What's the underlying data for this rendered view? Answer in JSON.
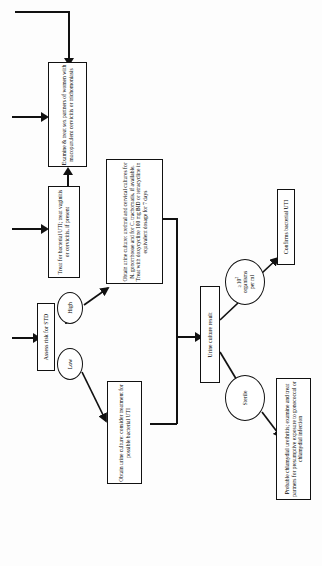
{
  "diagram": {
    "orientation": "rotated-90",
    "colors": {
      "stroke": "#111111",
      "fill": "#ffffff",
      "background": "#fdfdfd"
    }
  },
  "nodes": {
    "examine_treat_partners": {
      "id": "examine-treat-partners",
      "shape": "box",
      "text": "Examine & treat sex partners of women with mucopurulent cervicitis or trichomoniasis"
    },
    "treat_bacterial_uti": {
      "id": "treat-bacterial-uti",
      "shape": "box",
      "text": "Treat for bacterial UTI; treat vaginitis or cervicitis, if present"
    },
    "obtain_culture_high": {
      "id": "obtain-culture-high-risk",
      "shape": "box",
      "text": "Obtain urine culture: urethral and cervical cultures for N. gonorrhoeae and for C. trachomatis, if available. Treat with doxycycline 100 mg BID or tetracycline in equivalent dosage for 7 days",
      "lines": [
        "Obtain urine culture: urethral and",
        "cervical cultures for N. gonorrhoeae",
        "and for C. trachomatis, if available.",
        "Treat with doxycycline 100 mg",
        "BID or tetracycline in equivalent",
        "dosage for 7 days"
      ]
    },
    "assess_risk": {
      "id": "assess-risk-for-std",
      "shape": "box",
      "text": "Assess risk for STD"
    },
    "high": {
      "id": "branch-high",
      "shape": "ellipse",
      "text": "High"
    },
    "low": {
      "id": "branch-low",
      "shape": "ellipse",
      "text": "Low"
    },
    "obtain_culture_low": {
      "id": "obtain-culture-low-risk",
      "shape": "box",
      "text": "Obtain urine culture: consider treatment for possible bacterial UTI",
      "lines": [
        "Obtain urine culture: consider",
        "treatment for possible",
        "bacterial UTI"
      ]
    },
    "urine_culture_result": {
      "id": "urine-culture-result",
      "shape": "box",
      "text": "Urine culture result"
    },
    "organisms": {
      "id": "result-positive",
      "shape": "ellipse",
      "line1": "≥10",
      "exponent": "2",
      "line2": "organisms",
      "line3": "per ml",
      "text": "≥10² organisms per ml"
    },
    "sterile": {
      "id": "result-sterile",
      "shape": "ellipse",
      "text": "Sterile"
    },
    "confirms_uti": {
      "id": "confirms-bacterial-uti",
      "shape": "box",
      "text": "Confirms bacterial UTI"
    },
    "probable_chlamydial": {
      "id": "probable-chlamydial-urethritis",
      "shape": "box",
      "text": "Probable chlamydial urethritis; examine and treat partners for presumptive exposure to gonococcal or chlamydial infection",
      "lines": [
        "Probable chlamydial urethritis; examine and",
        "treat partners for presumptive exposure",
        "to gonococcal or chlamydial infection"
      ]
    }
  },
  "edges": [
    {
      "id": "edge-feedback-to-examine",
      "from": "feedback-loop",
      "to": "examine-treat-partners",
      "label": ""
    },
    {
      "id": "edge-entry-to-examine",
      "from": "entry-left",
      "to": "examine-treat-partners",
      "label": ""
    },
    {
      "id": "edge-entry-to-treat",
      "from": "entry-left",
      "to": "treat-bacterial-uti",
      "label": ""
    },
    {
      "id": "edge-treat-to-examine",
      "from": "treat-bacterial-uti",
      "to": "examine-treat-partners",
      "label": ""
    },
    {
      "id": "edge-entry-to-assess",
      "from": "entry-left",
      "to": "assess-risk-for-std",
      "label": ""
    },
    {
      "id": "edge-assess-to-high",
      "from": "assess-risk-for-std",
      "to": "branch-high",
      "label": "High"
    },
    {
      "id": "edge-assess-to-low",
      "from": "assess-risk-for-std",
      "to": "branch-low",
      "label": "Low"
    },
    {
      "id": "edge-high-to-culture",
      "from": "branch-high",
      "to": "obtain-culture-high-risk",
      "label": ""
    },
    {
      "id": "edge-low-to-culture",
      "from": "branch-low",
      "to": "obtain-culture-low-risk",
      "label": ""
    },
    {
      "id": "edge-cultures-to-result",
      "from": "obtain-culture-merge",
      "to": "urine-culture-result",
      "label": ""
    },
    {
      "id": "edge-result-to-organisms",
      "from": "urine-culture-result",
      "to": "result-positive",
      "label": ""
    },
    {
      "id": "edge-result-to-sterile",
      "from": "urine-culture-result",
      "to": "result-sterile",
      "label": ""
    },
    {
      "id": "edge-organisms-to-confirms",
      "from": "result-positive",
      "to": "confirms-bacterial-uti",
      "label": ""
    },
    {
      "id": "edge-sterile-to-chlamydial",
      "from": "result-sterile",
      "to": "probable-chlamydial-urethritis",
      "label": ""
    }
  ]
}
